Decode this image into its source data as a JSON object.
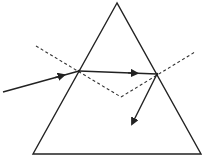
{
  "diagram": {
    "colors": {
      "background": "#ffffff",
      "stroke": "#222222",
      "dashed": "#333333"
    },
    "prism": {
      "apex": [
        117,
        3
      ],
      "base_left": [
        33,
        154
      ],
      "base_right": [
        201,
        154
      ]
    },
    "incident_ray": {
      "from": [
        3,
        92
      ],
      "to": [
        79,
        71
      ]
    },
    "internal_ray": {
      "from": [
        79,
        71
      ],
      "to": [
        157,
        74
      ]
    },
    "exit_ray": {
      "from": [
        157,
        74
      ],
      "to": [
        132,
        125
      ]
    },
    "normals": [
      {
        "from": [
          36,
          46
        ],
        "to": [
          121,
          97
        ]
      },
      {
        "from": [
          121,
          97
        ],
        "to": [
          195,
          52
        ]
      }
    ]
  }
}
